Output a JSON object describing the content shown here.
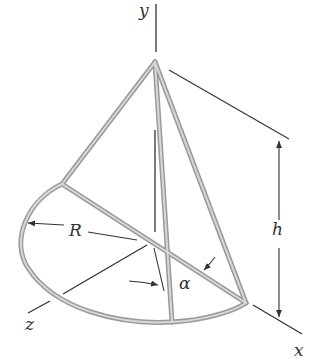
{
  "figure": {
    "labels": {
      "y_axis": "y",
      "x_axis": "x",
      "z_axis": "z",
      "radius": "R",
      "height": "h",
      "angle": "α"
    },
    "colors": {
      "rod_outer": "#9a9a9a",
      "rod_inner": "#d4d4d4",
      "line": "#333333",
      "background": "#ffffff"
    }
  }
}
